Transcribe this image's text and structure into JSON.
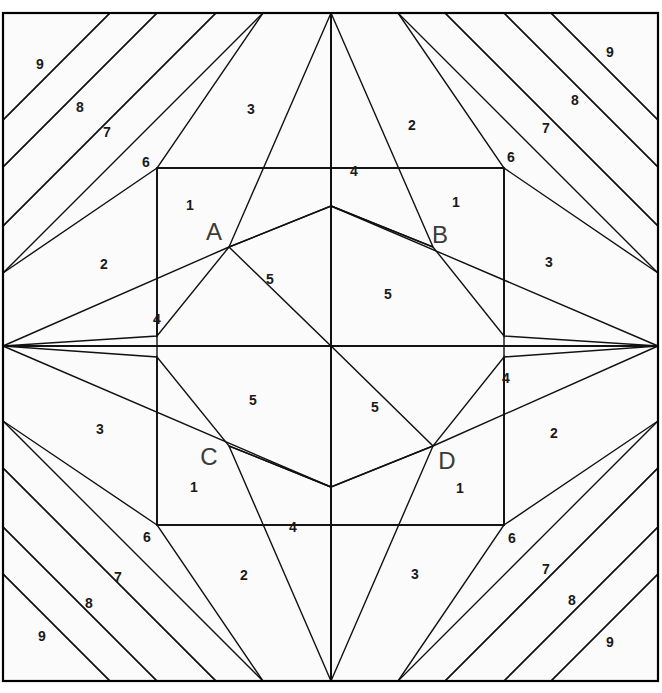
{
  "diagram": {
    "width": 662,
    "height": 693,
    "center": {
      "x": 330.5,
      "y": 346.5
    },
    "frame": {
      "left": 3,
      "top": 13,
      "right": 658,
      "bottom": 681
    },
    "inner_square": {
      "left": 157,
      "top": 168,
      "right": 504,
      "bottom": 525
    },
    "colors": {
      "background": "#ffffff",
      "white_piece": "#fbfbfb",
      "pale_piece": "#f2f2f2",
      "light_gray_piece": "#e3e3e3",
      "mid_light_piece": "#d2d2d2",
      "mid_gray_piece": "#c3c3c3",
      "stripe_gray": "#b3b3b3",
      "dark_gray_piece": "#c0c0c0",
      "outline": "#111111",
      "frame_outline": "#000000",
      "number_text": "#1a1a1a",
      "letter_text": "#3a3a3a"
    },
    "letters": [
      {
        "id": "A",
        "label": "A",
        "x": 214,
        "y": 234,
        "quadrant": "top-left"
      },
      {
        "id": "B",
        "label": "B",
        "x": 440,
        "y": 237,
        "quadrant": "top-right"
      },
      {
        "id": "C",
        "label": "C",
        "x": 209,
        "y": 459,
        "quadrant": "bottom-left"
      },
      {
        "id": "D",
        "label": "D",
        "x": 447,
        "y": 463,
        "quadrant": "bottom-right"
      }
    ],
    "numbers": [
      {
        "label": "9",
        "x": 40,
        "y": 65
      },
      {
        "label": "8",
        "x": 80,
        "y": 108
      },
      {
        "label": "7",
        "x": 107,
        "y": 133
      },
      {
        "label": "6",
        "x": 146,
        "y": 163
      },
      {
        "label": "3",
        "x": 251,
        "y": 110
      },
      {
        "label": "1",
        "x": 190,
        "y": 206
      },
      {
        "label": "2",
        "x": 104,
        "y": 265
      },
      {
        "label": "4",
        "x": 157,
        "y": 320
      },
      {
        "label": "5",
        "x": 270,
        "y": 280
      },
      {
        "label": "9",
        "x": 610,
        "y": 53
      },
      {
        "label": "8",
        "x": 575,
        "y": 101
      },
      {
        "label": "7",
        "x": 546,
        "y": 129
      },
      {
        "label": "6",
        "x": 511,
        "y": 158
      },
      {
        "label": "2",
        "x": 412,
        "y": 126
      },
      {
        "label": "4",
        "x": 354,
        "y": 172
      },
      {
        "label": "1",
        "x": 456,
        "y": 203
      },
      {
        "label": "3",
        "x": 549,
        "y": 263
      },
      {
        "label": "5",
        "x": 388,
        "y": 295
      },
      {
        "label": "3",
        "x": 100,
        "y": 430
      },
      {
        "label": "5",
        "x": 253,
        "y": 401
      },
      {
        "label": "1",
        "x": 194,
        "y": 488
      },
      {
        "label": "6",
        "x": 147,
        "y": 538
      },
      {
        "label": "7",
        "x": 118,
        "y": 578
      },
      {
        "label": "8",
        "x": 89,
        "y": 604
      },
      {
        "label": "9",
        "x": 42,
        "y": 637
      },
      {
        "label": "2",
        "x": 244,
        "y": 576
      },
      {
        "label": "4",
        "x": 293,
        "y": 528
      },
      {
        "label": "5",
        "x": 375,
        "y": 408
      },
      {
        "label": "4",
        "x": 506,
        "y": 379
      },
      {
        "label": "2",
        "x": 554,
        "y": 434
      },
      {
        "label": "1",
        "x": 460,
        "y": 489
      },
      {
        "label": "6",
        "x": 512,
        "y": 539
      },
      {
        "label": "7",
        "x": 546,
        "y": 570
      },
      {
        "label": "8",
        "x": 572,
        "y": 601
      },
      {
        "label": "9",
        "x": 610,
        "y": 643
      },
      {
        "label": "3",
        "x": 415,
        "y": 575
      }
    ]
  }
}
